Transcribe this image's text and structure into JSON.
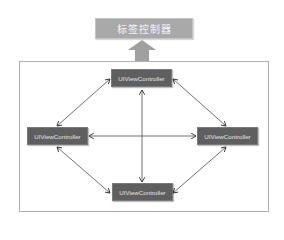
{
  "diagram": {
    "title": "标签控制器",
    "colors": {
      "title_box": "#a9a9a9",
      "controller_box": "#5f5f5f",
      "arrow": "#333333",
      "up_arrow": "#a0a0a0",
      "frame_border": "#b0b0b0"
    },
    "nodes": [
      {
        "id": "top",
        "label": "UIViewController"
      },
      {
        "id": "left",
        "label": "UIViewController"
      },
      {
        "id": "right",
        "label": "UIViewController"
      },
      {
        "id": "bottom",
        "label": "UIViewController"
      }
    ],
    "edges": [
      {
        "from": "top",
        "to": "left",
        "type": "bidirectional"
      },
      {
        "from": "top",
        "to": "right",
        "type": "bidirectional"
      },
      {
        "from": "top",
        "to": "bottom",
        "type": "bidirectional"
      },
      {
        "from": "left",
        "to": "right",
        "type": "bidirectional"
      },
      {
        "from": "left",
        "to": "bottom",
        "type": "bidirectional"
      },
      {
        "from": "right",
        "to": "bottom",
        "type": "bidirectional"
      },
      {
        "from": "frame",
        "to": "title",
        "type": "up-arrow"
      }
    ]
  }
}
